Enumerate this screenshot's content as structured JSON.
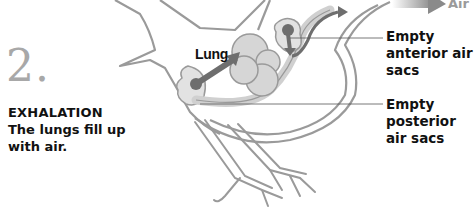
{
  "step": {
    "number": "2.",
    "title": "EXHALATION",
    "description": "The lungs fill up with air."
  },
  "labels": {
    "lung": "Lung",
    "anterior": "Empty anterior air sacs",
    "posterior": "Empty posterior air sacs"
  },
  "legend": {
    "air_label": "Air",
    "arrow_icon": "gradient-arrow-icon"
  },
  "colors": {
    "outline": "#9a9a9a",
    "lung_fill": "#d6d6d6",
    "sac_fill": "#e2e2e2",
    "air_arrow": "#6e6e6e",
    "text": "#111111",
    "step_number": "#a8a8a8"
  }
}
